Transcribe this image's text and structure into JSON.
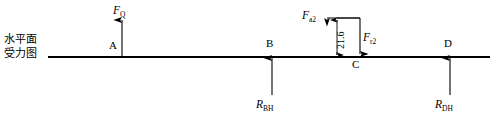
{
  "diagram": {
    "caption_lines": [
      "水平面",
      "受力图"
    ],
    "beam": {
      "x1": 48,
      "x2": 490,
      "y": 57
    },
    "stroke_color": "#000000",
    "background_color": "#ffffff",
    "points": [
      {
        "id": "A",
        "label": "A",
        "x": 122,
        "label_x": 109,
        "label_y": 39
      },
      {
        "id": "B",
        "label": "B",
        "x": 272,
        "label_x": 266,
        "label_y": 38
      },
      {
        "id": "C",
        "label": "C",
        "x": 355,
        "label_x": 352,
        "label_y": 58
      },
      {
        "id": "D",
        "label": "D",
        "x": 450,
        "label_x": 444,
        "label_y": 38
      }
    ],
    "forces": [
      {
        "id": "FQ",
        "symbol": "F",
        "subscript": "Q",
        "at_point": "A",
        "direction": "up",
        "x": 122,
        "tail_y": 56,
        "head_y": 20,
        "label_x": 113,
        "label_y": 5
      },
      {
        "id": "RBH",
        "symbol": "R",
        "subscript": "BH",
        "at_point": "B",
        "direction": "up",
        "x": 272,
        "tail_y": 95,
        "head_y": 58,
        "label_x": 257,
        "label_y": 99
      },
      {
        "id": "Fa2",
        "symbol": "F",
        "subscript": "a2",
        "at_point": "C",
        "direction": "left",
        "y": 18,
        "tail_x": 360,
        "head_x": 327,
        "label_x": 303,
        "label_y": 10
      },
      {
        "id": "Fr2",
        "symbol": "F",
        "subscript": "r2",
        "at_point": "C",
        "direction": "down",
        "x": 360,
        "tail_y": 18,
        "head_y": 54,
        "label_x": 363,
        "label_y": 32
      },
      {
        "id": "RDH",
        "symbol": "R",
        "subscript": "DH",
        "at_point": "D",
        "direction": "up",
        "x": 450,
        "tail_y": 95,
        "head_y": 58,
        "label_x": 436,
        "label_y": 99
      }
    ],
    "dimension": {
      "id": "offset-21-6",
      "value": "21.6",
      "x": 337,
      "y_top": 18,
      "y_bottom": 56,
      "text_x": 334,
      "text_y": 48
    }
  }
}
